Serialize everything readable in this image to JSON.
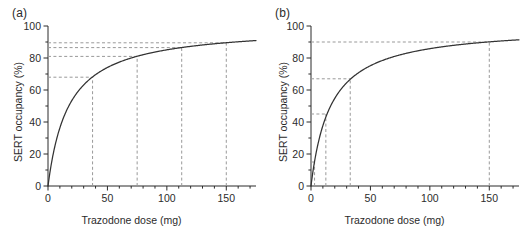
{
  "figure": {
    "background": "#ffffff",
    "axis_color": "#2b2b2b",
    "curve_color": "#333333",
    "dash_color": "#999999"
  },
  "panels": [
    {
      "label": "(a)",
      "name": "panel-a"
    },
    {
      "label": "(b)",
      "name": "panel-b"
    }
  ],
  "chart_data": [
    {
      "type": "line",
      "panel": "(a)",
      "title": "",
      "xlabel": "Trazodone dose (mg)",
      "ylabel": "SERT occupancy (%)",
      "xlim": [
        0,
        175
      ],
      "ylim": [
        0,
        100
      ],
      "xticks": [
        0,
        50,
        100,
        150
      ],
      "xticklabels": [
        "0",
        "50",
        "100",
        "150"
      ],
      "yticks": [
        0,
        20,
        40,
        60,
        80,
        100
      ],
      "yticklabels": [
        "0",
        "20",
        "40",
        "60",
        "80",
        "100"
      ],
      "x_minor_tick_step": 10,
      "y_minor_tick_step": 10,
      "grid": false,
      "legend": null,
      "model": "Emax hyperbola: occupancy = Emax * dose / (ED50 + dose)",
      "emax": 100,
      "ed50": 17.5,
      "series": [
        {
          "name": "SERT occupancy curve (a)",
          "x": [
            0,
            2,
            4,
            6,
            8,
            10,
            12.5,
            15,
            17.5,
            20,
            25,
            30,
            37.5,
            45,
            55,
            65,
            75,
            90,
            100,
            112.5,
            125,
            137.5,
            150,
            160,
            175
          ],
          "y": [
            0,
            10.3,
            18.6,
            25.5,
            31.4,
            36.4,
            41.7,
            46.2,
            50.0,
            53.3,
            58.8,
            63.2,
            68.2,
            72.0,
            75.9,
            78.8,
            81.1,
            83.7,
            85.1,
            86.5,
            87.7,
            88.7,
            89.6,
            90.1,
            90.9
          ]
        }
      ],
      "reference_lines": [
        {
          "dose": 37.5,
          "occupancy": 68
        },
        {
          "dose": 75,
          "occupancy": 81
        },
        {
          "dose": 112.5,
          "occupancy": 86.5
        },
        {
          "dose": 150,
          "occupancy": 89.5
        }
      ]
    },
    {
      "type": "line",
      "panel": "(b)",
      "title": "",
      "xlabel": "Trazodone dose (mg)",
      "ylabel": "SERT occupancy (%)",
      "xlim": [
        0,
        175
      ],
      "ylim": [
        0,
        100
      ],
      "xticks": [
        0,
        50,
        100,
        150
      ],
      "xticklabels": [
        "0",
        "50",
        "100",
        "150"
      ],
      "yticks": [
        0,
        20,
        40,
        60,
        80,
        100
      ],
      "yticklabels": [
        "0",
        "20",
        "40",
        "60",
        "80",
        "100"
      ],
      "x_minor_tick_step": 10,
      "y_minor_tick_step": 10,
      "grid": false,
      "legend": null,
      "model": "Emax hyperbola: occupancy = Emax * dose / (ED50 + dose)",
      "emax": 100,
      "ed50": 16.5,
      "series": [
        {
          "name": "SERT occupancy curve (b)",
          "x": [
            0,
            1.5,
            3,
            5,
            7.5,
            10,
            12.5,
            15,
            20,
            25,
            33,
            40,
            50,
            65,
            80,
            100,
            125,
            150,
            175
          ],
          "y": [
            0,
            8.3,
            15.4,
            23.3,
            31.3,
            37.7,
            43.1,
            47.6,
            54.8,
            60.2,
            66.7,
            70.8,
            75.2,
            79.8,
            82.9,
            85.8,
            88.3,
            90.1,
            91.4
          ]
        }
      ],
      "reference_lines": [
        {
          "dose": 3,
          "occupancy": 15
        },
        {
          "dose": 12.5,
          "occupancy": 45
        },
        {
          "dose": 33,
          "occupancy": 67
        },
        {
          "dose": 150,
          "occupancy": 90
        }
      ]
    }
  ]
}
